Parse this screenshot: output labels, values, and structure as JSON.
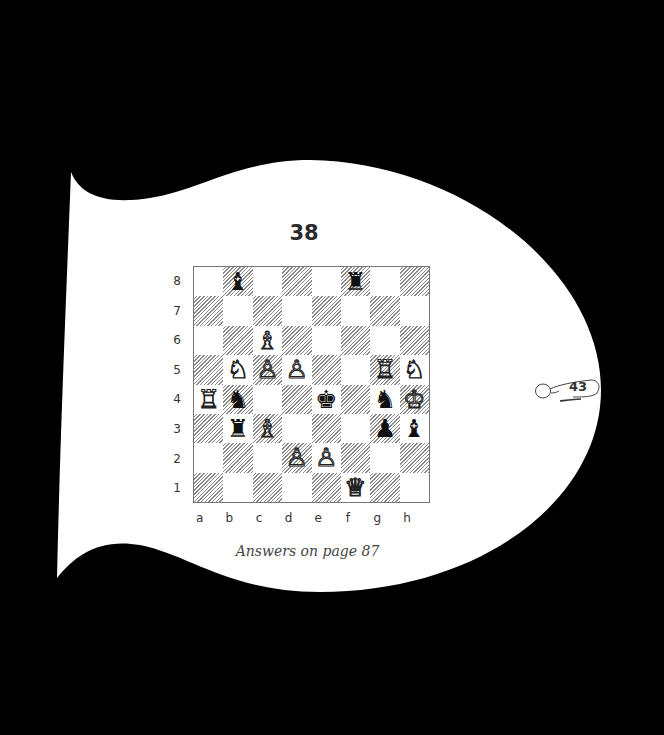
{
  "puzzle": {
    "number": "38",
    "caption": "Answers on page 87",
    "page_number": "43"
  },
  "board": {
    "files": [
      "a",
      "b",
      "c",
      "d",
      "e",
      "f",
      "g",
      "h"
    ],
    "ranks": [
      "8",
      "7",
      "6",
      "5",
      "4",
      "3",
      "2",
      "1"
    ],
    "pieces": [
      {
        "square": "b8",
        "color": "black",
        "type": "bishop",
        "glyph": "♝"
      },
      {
        "square": "f8",
        "color": "black",
        "type": "rook",
        "glyph": "♜"
      },
      {
        "square": "c6",
        "color": "white",
        "type": "bishop",
        "glyph": "♗"
      },
      {
        "square": "b5",
        "color": "white",
        "type": "knight",
        "glyph": "♘"
      },
      {
        "square": "c5",
        "color": "white",
        "type": "pawn",
        "glyph": "♙"
      },
      {
        "square": "d5",
        "color": "white",
        "type": "pawn",
        "glyph": "♙"
      },
      {
        "square": "g5",
        "color": "white",
        "type": "rook",
        "glyph": "♖"
      },
      {
        "square": "h5",
        "color": "white",
        "type": "knight",
        "glyph": "♘"
      },
      {
        "square": "a4",
        "color": "white",
        "type": "rook",
        "glyph": "♖"
      },
      {
        "square": "b4",
        "color": "black",
        "type": "knight",
        "glyph": "♞"
      },
      {
        "square": "e4",
        "color": "black",
        "type": "king",
        "glyph": "♚"
      },
      {
        "square": "g4",
        "color": "black",
        "type": "knight",
        "glyph": "♞"
      },
      {
        "square": "h4",
        "color": "white",
        "type": "king",
        "glyph": "♔"
      },
      {
        "square": "b3",
        "color": "black",
        "type": "rook",
        "glyph": "♜"
      },
      {
        "square": "c3",
        "color": "white",
        "type": "bishop",
        "glyph": "♗"
      },
      {
        "square": "g3",
        "color": "black",
        "type": "pawn",
        "glyph": "♟"
      },
      {
        "square": "h3",
        "color": "black",
        "type": "bishop",
        "glyph": "♝"
      },
      {
        "square": "d2",
        "color": "white",
        "type": "pawn",
        "glyph": "♙"
      },
      {
        "square": "e2",
        "color": "white",
        "type": "pawn",
        "glyph": "♙"
      },
      {
        "square": "f1",
        "color": "white",
        "type": "queen",
        "glyph": "♕"
      }
    ]
  },
  "colors": {
    "background": "#000000",
    "page": "#ffffff",
    "text": "#2a2a2a"
  }
}
